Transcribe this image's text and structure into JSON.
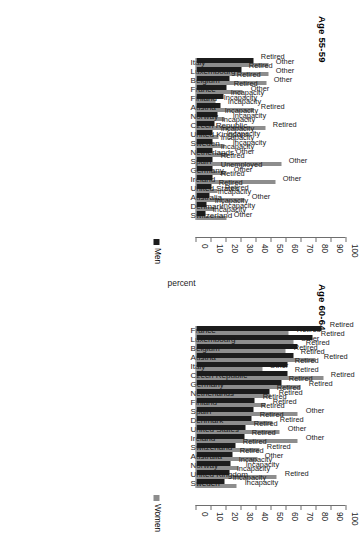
{
  "figure": {
    "legend": [
      {
        "name": "legend-men",
        "label": "Men",
        "color": "#1c1c1c"
      },
      {
        "name": "legend-women",
        "label": "Women",
        "color": "#8d8d8d"
      }
    ],
    "axis_title": "percent",
    "ticks": [
      "0",
      "10",
      "20",
      "30",
      "40",
      "50",
      "60",
      "70",
      "80",
      "90",
      "100"
    ]
  },
  "chart_data": [
    {
      "type": "bar",
      "title": "Age 60-64",
      "xlabel": "",
      "ylabel": "percent",
      "ylim": [
        0,
        100
      ],
      "grid": false,
      "legend_position": "right",
      "categories": [
        "France",
        "Luxembourg",
        "Belgium",
        "Austria",
        "Italy",
        "Czech Republic",
        "Germany",
        "Netherlands",
        "Finland",
        "Spain",
        "Denmark",
        "United States",
        "Ireland",
        "Switzerland",
        "Australia",
        "Norway",
        "United Kingdom",
        "Sweden"
      ],
      "series": [
        {
          "name": "Men",
          "color": "#1c1c1c",
          "values": [
            84,
            78,
            68,
            65,
            61,
            61,
            57,
            49,
            39,
            38,
            37,
            33,
            32,
            26,
            24,
            23,
            22,
            19
          ]
        },
        {
          "name": "Women",
          "color": "#8d8d8d",
          "values": [
            62,
            65,
            60,
            80,
            44,
            85,
            70,
            50,
            46,
            68,
            51,
            56,
            68,
            42,
            41,
            28,
            54,
            27
          ]
        }
      ],
      "bar_labels": {
        "Men": [
          "Retired",
          "Retired",
          "Retired",
          "Retired",
          "Retired",
          "Retired",
          "Retired",
          "Retired",
          "Retired",
          "Retired",
          "Retired",
          "Retired",
          "Retired",
          "Retired",
          "Retired",
          "Incapacity",
          "Incapacity",
          "Incapacity"
        ],
        "Women": [
          "Retired",
          "Other",
          "Retired",
          "Retired",
          "Other",
          "Retired",
          "Retired",
          "Retired",
          "Retired",
          "Other",
          "Retired",
          "Other",
          "Other",
          "Retired",
          "Other",
          "Incapacity",
          "Retired",
          "Incapacity"
        ]
      }
    },
    {
      "type": "bar",
      "title": "Age 55-59",
      "xlabel": "",
      "ylabel": "percent",
      "ylim": [
        0,
        100
      ],
      "grid": false,
      "legend_position": "right",
      "categories": [
        "Italy",
        "Luxembourg",
        "Belgium",
        "France",
        "Finland",
        "Austria",
        "Norway",
        "Czech Republic",
        "United Kingdom",
        "Sweden",
        "Netherlands",
        "Spain",
        "Germany",
        "Ireland",
        "United States",
        "Australia",
        "Denmark",
        "Switzerland"
      ],
      "series": [
        {
          "name": "Men",
          "color": "#1c1c1c",
          "values": [
            38,
            30,
            22,
            20,
            18,
            16,
            14,
            12,
            11,
            11,
            11,
            11,
            11,
            11,
            10,
            9,
            7,
            6
          ]
        },
        {
          "name": "Women",
          "color": "#8d8d8d",
          "values": [
            48,
            48,
            47,
            31,
            13,
            38,
            19,
            46,
            15,
            19,
            21,
            57,
            20,
            53,
            14,
            32,
            12,
            20
          ]
        }
      ],
      "bar_labels": {
        "Men": [
          "Retired",
          "Retired",
          "Retired",
          "Retired",
          "Incapacity",
          "Incapacity",
          "Incapacity",
          "Incapacity",
          "Incapacity",
          "Incapacity",
          "Incapacity",
          "Retired",
          "Unemployed",
          "Retired",
          "Retired",
          "Incapacity",
          "Incapacity",
          "Incapacity"
        ],
        "Women": [
          "Other",
          "Other",
          "Other",
          "Other",
          "Incapacity",
          "Retired",
          "Incapacity",
          "Retired",
          "Incapacity",
          "Incapacity",
          "Other",
          "Other",
          "Other",
          "Other",
          "Retired",
          "Other",
          "Incapacity",
          "Other"
        ]
      }
    }
  ]
}
